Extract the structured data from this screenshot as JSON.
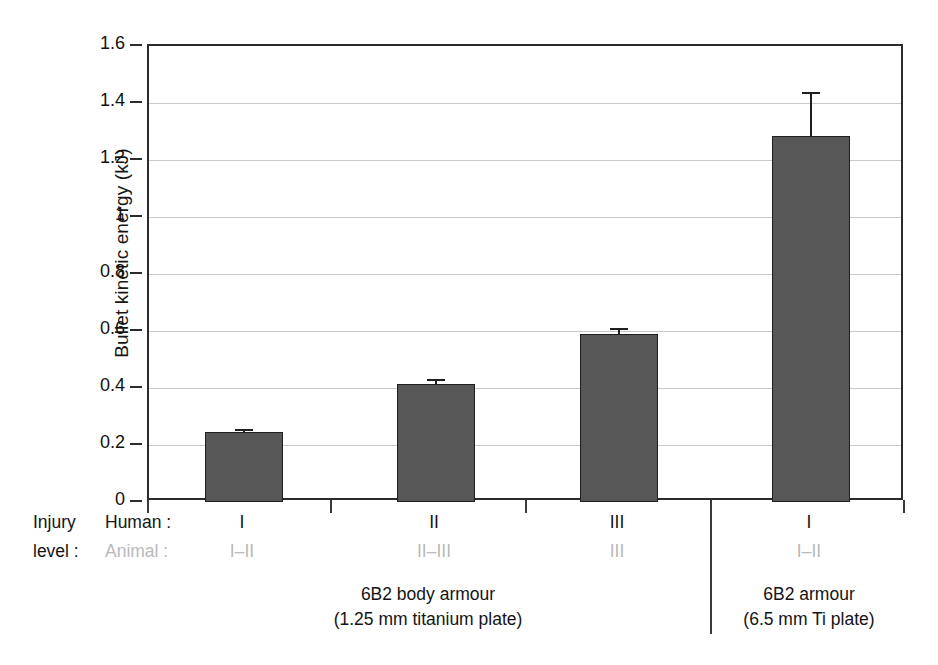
{
  "chart_data": {
    "type": "bar",
    "title": "",
    "xlabel": "",
    "ylabel": "Bullet kinetic energy (kJ)",
    "ylim": [
      0,
      1.6
    ],
    "ytick_step": 0.2,
    "yticks": [
      "0",
      "0.2",
      "0.4",
      "0.6",
      "0.8",
      "1",
      "1.2",
      "1.4",
      "1.6"
    ],
    "ytick_values": [
      0,
      0.2,
      0.4,
      0.6,
      0.8,
      1.0,
      1.2,
      1.4,
      1.6
    ],
    "grid": "horizontal",
    "legend": "none",
    "bar_color": "#575757",
    "bar_edge_color": "#1e1e1e",
    "gridline_color": "#c9c9c9",
    "animal_label_color": "#b9b9b9",
    "categories": [
      "I",
      "II",
      "III",
      "I"
    ],
    "values": [
      0.245,
      0.415,
      0.59,
      1.285
    ],
    "errors": [
      0.012,
      0.018,
      0.022,
      0.155
    ],
    "series": [
      {
        "name": "Bullet kinetic energy",
        "values": [
          0.245,
          0.415,
          0.59,
          1.285
        ],
        "errors": [
          0.012,
          0.018,
          0.022,
          0.155
        ]
      }
    ],
    "points": [
      {
        "human_injury_level": "I",
        "animal_injury_level": "I–II",
        "value": 0.245,
        "error": 0.012,
        "group": "6B2 body armour (1.25 mm titanium plate)"
      },
      {
        "human_injury_level": "II",
        "animal_injury_level": "II–III",
        "value": 0.415,
        "error": 0.018,
        "group": "6B2 body armour (1.25 mm titanium plate)"
      },
      {
        "human_injury_level": "III",
        "animal_injury_level": "III",
        "value": 0.59,
        "error": 0.022,
        "group": "6B2 body armour (1.25 mm titanium plate)"
      },
      {
        "human_injury_level": "I",
        "animal_injury_level": "I–II",
        "value": 1.285,
        "error": 0.155,
        "group": "6B2 armour (6.5 mm Ti plate)"
      }
    ],
    "groups": [
      {
        "line1": "6B2 body armour",
        "line2": "(1.25 mm titanium plate)",
        "bars": [
          0,
          1,
          2
        ]
      },
      {
        "line1": "6B2 armour",
        "line2": "(6.5 mm Ti plate)",
        "bars": [
          3
        ]
      }
    ]
  },
  "axis_labels": {
    "injury_line1": "Injury",
    "injury_line2": "level :",
    "human_row": "Human :",
    "animal_row": "Animal :"
  }
}
